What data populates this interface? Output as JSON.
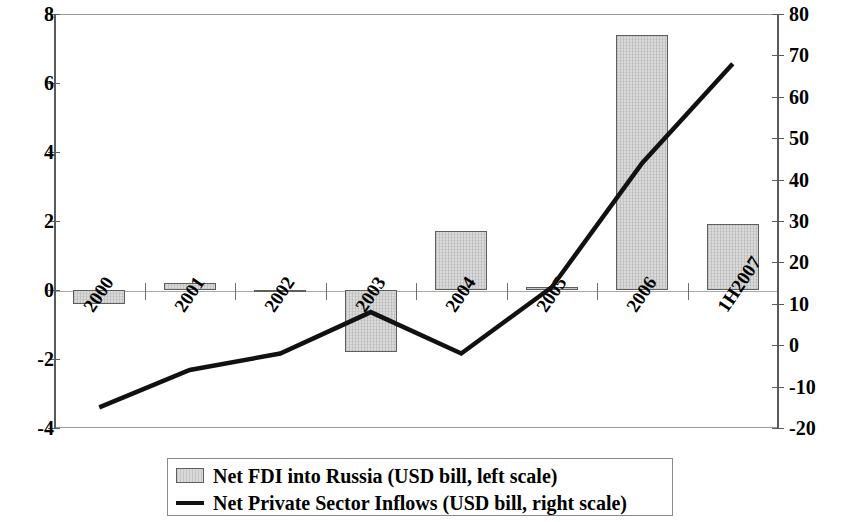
{
  "chart_data": {
    "type": "bar",
    "title": "",
    "xlabel": "",
    "categories": [
      "2000",
      "2001",
      "2002",
      "2003",
      "2004",
      "2005",
      "2006",
      "1H2007"
    ],
    "series": [
      {
        "name": "Net FDI into Russia (USD bill, left scale)",
        "type": "bar",
        "axis": "left",
        "values": [
          -0.4,
          0.2,
          -0.05,
          -1.8,
          1.7,
          0.1,
          7.4,
          1.9
        ]
      },
      {
        "name": "Net Private Sector Inflows (USD bill, right scale)",
        "type": "line",
        "axis": "right",
        "values": [
          -15,
          -6,
          -2,
          8,
          -2,
          14,
          44,
          68
        ]
      }
    ],
    "left_axis": {
      "label": "",
      "ylim": [
        -4,
        8
      ],
      "ticks": [
        "8",
        "6",
        "4",
        "2",
        "0",
        "-2",
        "-4"
      ],
      "tick_values": [
        8,
        6,
        4,
        2,
        0,
        -2,
        -4
      ]
    },
    "right_axis": {
      "label": "",
      "ylim": [
        -20,
        80
      ],
      "ticks": [
        "80",
        "70",
        "60",
        "50",
        "40",
        "30",
        "20",
        "10",
        "0",
        "-10",
        "-20"
      ],
      "tick_values": [
        80,
        70,
        60,
        50,
        40,
        30,
        20,
        10,
        0,
        -10,
        -20
      ]
    },
    "grid": false,
    "legend_position": "bottom"
  },
  "legend": {
    "items": [
      {
        "label": "Net FDI into Russia (USD bill, left scale)",
        "marker": "bar-swatch-icon",
        "color": "#d9d9d9"
      },
      {
        "label": "Net Private Sector Inflows (USD bill, right scale)",
        "marker": "line-swatch-icon",
        "color": "#111111"
      }
    ]
  },
  "colors": {
    "bar_fill": "#d9d9d9",
    "bar_stroke": "#5e5e5e",
    "line": "#111111",
    "axis": "#5a5a5a",
    "frame": "#9a9a9a"
  }
}
